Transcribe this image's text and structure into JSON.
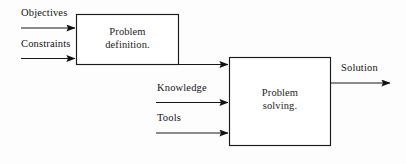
{
  "diagram": {
    "type": "flowchart",
    "title": "",
    "background_color": "#fdfdfd",
    "line_color": "#1a1a1a",
    "boxes": [
      {
        "id": "problem-definition",
        "label": "Problem\ndefinition.",
        "x": 76,
        "y": 14,
        "width": 103,
        "height": 51
      },
      {
        "id": "problem-solving",
        "label": "Problem\nsolving.",
        "x": 229,
        "y": 57,
        "width": 102,
        "height": 89
      }
    ],
    "inputs": [
      {
        "id": "objectives",
        "label": "Objectives",
        "target": "problem-definition"
      },
      {
        "id": "constraints",
        "label": "Constraints",
        "target": "problem-definition"
      },
      {
        "id": "knowledge",
        "label": "Knowledge",
        "target": "problem-solving"
      },
      {
        "id": "tools",
        "label": "Tools",
        "target": "problem-solving"
      }
    ],
    "outputs": [
      {
        "id": "solution",
        "label": "Solution",
        "source": "problem-solving"
      }
    ],
    "connectors": [
      {
        "id": "definition-to-solving",
        "from": "problem-definition",
        "to": "problem-solving",
        "label": ""
      }
    ]
  }
}
